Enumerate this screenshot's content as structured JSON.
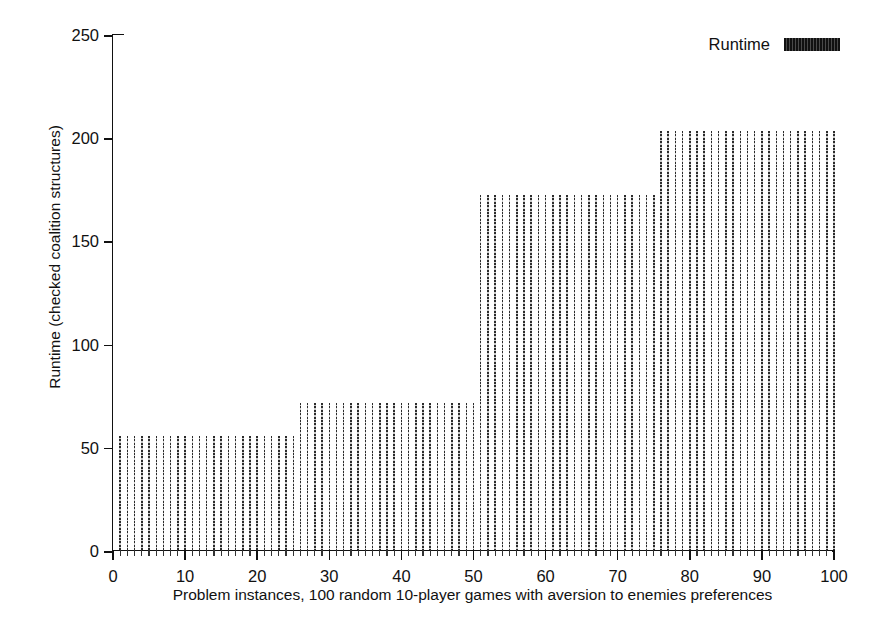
{
  "chart_data": {
    "type": "bar",
    "title": "",
    "xlabel": "Problem instances, 100 random 10-player games with aversion to enemies preferences",
    "ylabel": "Runtime (checked coalition structures)",
    "xlim": [
      0,
      100
    ],
    "ylim": [
      0,
      250
    ],
    "grid": false,
    "legend_position": "top-right",
    "legend": [
      {
        "name": "Runtime",
        "swatch": "dense-vertical-hatch"
      }
    ],
    "x_ticks": [
      0,
      10,
      20,
      30,
      40,
      50,
      60,
      70,
      80,
      90,
      100
    ],
    "x_minor_tick_step": 1,
    "y_ticks": [
      0,
      50,
      100,
      150,
      200,
      250
    ],
    "series": [
      {
        "name": "Runtime",
        "x": [
          1,
          2,
          3,
          4,
          5,
          6,
          7,
          8,
          9,
          10,
          11,
          12,
          13,
          14,
          15,
          16,
          17,
          18,
          19,
          20,
          21,
          22,
          23,
          24,
          25,
          26,
          27,
          28,
          29,
          30,
          31,
          32,
          33,
          34,
          35,
          36,
          37,
          38,
          39,
          40,
          41,
          42,
          43,
          44,
          45,
          46,
          47,
          48,
          49,
          50,
          51,
          52,
          53,
          54,
          55,
          56,
          57,
          58,
          59,
          60,
          61,
          62,
          63,
          64,
          65,
          66,
          67,
          68,
          69,
          70,
          71,
          72,
          73,
          74,
          75,
          76,
          77,
          78,
          79,
          80,
          81,
          82,
          83,
          84,
          85,
          86,
          87,
          88,
          89,
          90,
          91,
          92,
          93,
          94,
          95,
          96,
          97,
          98,
          99,
          100
        ],
        "values": [
          55,
          55,
          55,
          55,
          55,
          55,
          55,
          55,
          55,
          55,
          55,
          55,
          55,
          55,
          55,
          55,
          55,
          55,
          55,
          55,
          55,
          55,
          55,
          55,
          55,
          71,
          71,
          71,
          71,
          71,
          71,
          71,
          71,
          71,
          71,
          71,
          71,
          71,
          71,
          71,
          71,
          71,
          71,
          71,
          71,
          71,
          71,
          71,
          71,
          71,
          172,
          172,
          172,
          172,
          172,
          172,
          172,
          172,
          172,
          172,
          172,
          172,
          172,
          172,
          172,
          172,
          172,
          172,
          172,
          172,
          172,
          172,
          172,
          172,
          172,
          203,
          203,
          203,
          203,
          203,
          203,
          203,
          203,
          203,
          203,
          203,
          203,
          203,
          203,
          203,
          203,
          203,
          203,
          203,
          203,
          203,
          203,
          203,
          203,
          203
        ]
      }
    ],
    "plateaus": [
      {
        "x_from": 1,
        "x_to": 25,
        "value": 55
      },
      {
        "x_from": 26,
        "x_to": 50,
        "value": 71
      },
      {
        "x_from": 51,
        "x_to": 75,
        "value": 172
      },
      {
        "x_from": 76,
        "x_to": 100,
        "value": 203
      }
    ],
    "colors": {
      "bar": "#2b2b2b",
      "axis": "#111111",
      "background": "#ffffff"
    }
  }
}
